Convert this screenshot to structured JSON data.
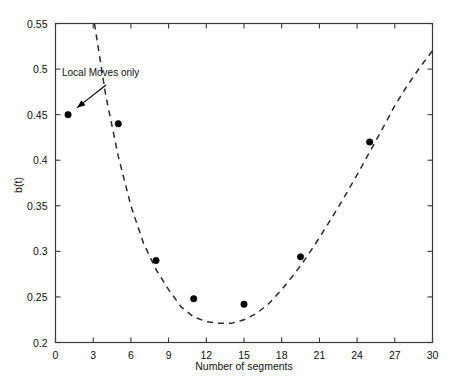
{
  "chart_data": {
    "type": "scatter",
    "title": "",
    "xlabel": "Number of segments",
    "ylabel": "b(t)",
    "xlim": [
      0,
      30
    ],
    "ylim": [
      0.2,
      0.55
    ],
    "grid": false,
    "legend": null,
    "xticks": [
      "0",
      "3",
      "6",
      "9",
      "12",
      "15",
      "18",
      "21",
      "24",
      "27",
      "30"
    ],
    "xtick_values": [
      0,
      3,
      6,
      9,
      12,
      15,
      18,
      21,
      24,
      27,
      30
    ],
    "yticks": [
      "0.2",
      "0.25",
      "0.3",
      "0.35",
      "0.4",
      "0.45",
      "0.5",
      "0.55"
    ],
    "ytick_values": [
      0.2,
      0.25,
      0.3,
      0.35,
      0.4,
      0.45,
      0.5,
      0.55
    ],
    "series": [
      {
        "name": "Local Moves only",
        "type": "scatter",
        "marker": "filled-circle",
        "color": "#000000",
        "x": [
          1,
          5,
          8,
          11,
          15,
          19.5,
          25
        ],
        "y": [
          0.45,
          0.44,
          0.29,
          0.248,
          0.242,
          0.294,
          0.42
        ]
      },
      {
        "name": "fitted curve",
        "type": "line",
        "style": "dashed",
        "color": "#2b2b2b",
        "x": [
          3.1,
          4,
          5,
          6,
          7,
          8,
          9,
          10,
          11,
          12,
          13,
          14,
          15,
          16,
          17,
          18,
          19,
          20,
          21,
          22,
          23,
          24,
          25,
          26,
          27,
          28,
          29,
          30
        ],
        "y": [
          0.55,
          0.471,
          0.404,
          0.35,
          0.309,
          0.28,
          0.258,
          0.239,
          0.228,
          0.223,
          0.221,
          0.221,
          0.225,
          0.232,
          0.243,
          0.258,
          0.275,
          0.294,
          0.315,
          0.337,
          0.36,
          0.384,
          0.409,
          0.434,
          0.46,
          0.482,
          0.502,
          0.52
        ]
      }
    ],
    "annotations": [
      {
        "text": "Local Moves only",
        "points_to_x": 1,
        "points_to_y": 0.45
      }
    ]
  }
}
